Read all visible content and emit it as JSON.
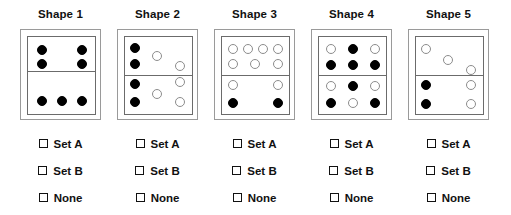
{
  "layout": {
    "columns": 5,
    "column_width": 97,
    "column_left_offsets": [
      12,
      109,
      206,
      303,
      400
    ]
  },
  "colors": {
    "filled_dot": "#000000",
    "open_dot_border": "#8c8c8c",
    "inner_box_border": "#6b6b6b",
    "outer_box_border": "#9a9a9a",
    "text": "#111111",
    "background": "#ffffff"
  },
  "options": [
    {
      "label": "Set A",
      "checked": false
    },
    {
      "label": "Set B",
      "checked": false
    },
    {
      "label": "None",
      "checked": false
    }
  ],
  "shapes": [
    {
      "title": "Shape 1",
      "divider_y": 34,
      "dots": [
        {
          "x": 9,
          "y": 8,
          "r": 5,
          "fill": "filled"
        },
        {
          "x": 49,
          "y": 8,
          "r": 5,
          "fill": "filled"
        },
        {
          "x": 9,
          "y": 22,
          "r": 5,
          "fill": "filled"
        },
        {
          "x": 49,
          "y": 22,
          "r": 5,
          "fill": "filled"
        },
        {
          "x": 9,
          "y": 59,
          "r": 5,
          "fill": "filled"
        },
        {
          "x": 29,
          "y": 59,
          "r": 5,
          "fill": "filled"
        },
        {
          "x": 49,
          "y": 59,
          "r": 5,
          "fill": "filled"
        }
      ]
    },
    {
      "title": "Shape 2",
      "divider_y": 38,
      "dots": [
        {
          "x": 5,
          "y": 6,
          "r": 5,
          "fill": "filled"
        },
        {
          "x": 27,
          "y": 14,
          "r": 5,
          "fill": "open"
        },
        {
          "x": 5,
          "y": 22,
          "r": 5,
          "fill": "filled"
        },
        {
          "x": 50,
          "y": 24,
          "r": 5,
          "fill": "open"
        },
        {
          "x": 5,
          "y": 42,
          "r": 5,
          "fill": "filled"
        },
        {
          "x": 50,
          "y": 40,
          "r": 5,
          "fill": "open"
        },
        {
          "x": 27,
          "y": 52,
          "r": 5,
          "fill": "open"
        },
        {
          "x": 5,
          "y": 60,
          "r": 5,
          "fill": "filled"
        },
        {
          "x": 50,
          "y": 60,
          "r": 5,
          "fill": "open"
        }
      ]
    },
    {
      "title": "Shape 3",
      "divider_y": 38,
      "dots": [
        {
          "x": 6,
          "y": 7,
          "r": 5,
          "fill": "open"
        },
        {
          "x": 21,
          "y": 7,
          "r": 5,
          "fill": "open"
        },
        {
          "x": 36,
          "y": 7,
          "r": 5,
          "fill": "open"
        },
        {
          "x": 51,
          "y": 7,
          "r": 5,
          "fill": "open"
        },
        {
          "x": 6,
          "y": 22,
          "r": 5,
          "fill": "open"
        },
        {
          "x": 28,
          "y": 22,
          "r": 5,
          "fill": "open"
        },
        {
          "x": 51,
          "y": 22,
          "r": 5,
          "fill": "open"
        },
        {
          "x": 6,
          "y": 43,
          "r": 5,
          "fill": "open"
        },
        {
          "x": 51,
          "y": 43,
          "r": 5,
          "fill": "open"
        },
        {
          "x": 6,
          "y": 61,
          "r": 5,
          "fill": "filled"
        },
        {
          "x": 51,
          "y": 61,
          "r": 5,
          "fill": "filled"
        }
      ]
    },
    {
      "title": "Shape 4",
      "divider_y": 38,
      "dots": [
        {
          "x": 7,
          "y": 7,
          "r": 5,
          "fill": "open"
        },
        {
          "x": 29,
          "y": 7,
          "r": 5,
          "fill": "filled"
        },
        {
          "x": 51,
          "y": 7,
          "r": 5,
          "fill": "open"
        },
        {
          "x": 7,
          "y": 23,
          "r": 5,
          "fill": "filled"
        },
        {
          "x": 29,
          "y": 23,
          "r": 5,
          "fill": "filled"
        },
        {
          "x": 51,
          "y": 23,
          "r": 5,
          "fill": "filled"
        },
        {
          "x": 7,
          "y": 44,
          "r": 5,
          "fill": "open"
        },
        {
          "x": 29,
          "y": 44,
          "r": 5,
          "fill": "filled"
        },
        {
          "x": 51,
          "y": 44,
          "r": 5,
          "fill": "open"
        },
        {
          "x": 7,
          "y": 61,
          "r": 5,
          "fill": "filled"
        },
        {
          "x": 29,
          "y": 61,
          "r": 5,
          "fill": "open"
        },
        {
          "x": 51,
          "y": 61,
          "r": 5,
          "fill": "filled"
        }
      ]
    },
    {
      "title": "Shape 5",
      "divider_y": 38,
      "dots": [
        {
          "x": 5,
          "y": 7,
          "r": 5,
          "fill": "open"
        },
        {
          "x": 27,
          "y": 18,
          "r": 5,
          "fill": "open"
        },
        {
          "x": 50,
          "y": 28,
          "r": 5,
          "fill": "open"
        },
        {
          "x": 5,
          "y": 43,
          "r": 5,
          "fill": "filled"
        },
        {
          "x": 50,
          "y": 43,
          "r": 5,
          "fill": "open"
        },
        {
          "x": 5,
          "y": 62,
          "r": 5,
          "fill": "filled"
        },
        {
          "x": 50,
          "y": 62,
          "r": 5,
          "fill": "open"
        }
      ]
    }
  ]
}
